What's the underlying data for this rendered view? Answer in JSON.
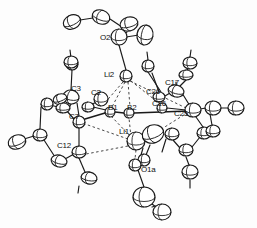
{
  "figure": {
    "kind": "ortep-crystal-structure-diagram",
    "width": 257,
    "height": 228,
    "background_color": "#fdfdfd",
    "line_color": "#1a1a1a",
    "ellipsoid_fill": "#ffffff",
    "dashed_bond_color": "#333333"
  },
  "labels": [
    {
      "text": "O2",
      "x": 100,
      "y": 34
    },
    {
      "text": "Li2",
      "x": 104,
      "y": 71
    },
    {
      "text": "C3",
      "x": 71,
      "y": 85
    },
    {
      "text": "C2",
      "x": 91,
      "y": 89
    },
    {
      "text": "C17",
      "x": 165,
      "y": 79
    },
    {
      "text": "C26",
      "x": 146,
      "y": 88
    },
    {
      "text": "C16",
      "x": 152,
      "y": 100
    },
    {
      "text": "B1",
      "x": 108,
      "y": 104
    },
    {
      "text": "B2",
      "x": 127,
      "y": 104
    },
    {
      "text": "C7",
      "x": 69,
      "y": 113
    },
    {
      "text": "C25",
      "x": 174,
      "y": 110
    },
    {
      "text": "Li1",
      "x": 119,
      "y": 128
    },
    {
      "text": "C12",
      "x": 57,
      "y": 142
    },
    {
      "text": "O1a",
      "x": 141,
      "y": 166
    }
  ],
  "atoms": [
    {
      "id": "e1",
      "cx": 72,
      "cy": 22,
      "rx": 9,
      "ry": 7,
      "rot": -25
    },
    {
      "id": "e2",
      "cx": 101,
      "cy": 17,
      "rx": 9,
      "ry": 7,
      "rot": 20
    },
    {
      "id": "e3",
      "cx": 129,
      "cy": 24,
      "rx": 9,
      "ry": 7,
      "rot": -15
    },
    {
      "id": "o2",
      "cx": 119,
      "cy": 37,
      "rx": 8,
      "ry": 8,
      "rot": 0
    },
    {
      "id": "e4",
      "cx": 145,
      "cy": 35,
      "rx": 8,
      "ry": 10,
      "rot": 10
    },
    {
      "id": "li2",
      "cx": 126,
      "cy": 76,
      "rx": 6,
      "ry": 6,
      "rot": 0
    },
    {
      "id": "e5",
      "cx": 148,
      "cy": 66,
      "rx": 6,
      "ry": 6,
      "rot": 0
    },
    {
      "id": "e6",
      "cx": 190,
      "cy": 63,
      "rx": 7,
      "ry": 6,
      "rot": 0
    },
    {
      "id": "e7",
      "cx": 72,
      "cy": 64,
      "rx": 6,
      "ry": 6,
      "rot": 0
    },
    {
      "id": "c3",
      "cx": 71,
      "cy": 97,
      "rx": 8,
      "ry": 7,
      "rot": 10
    },
    {
      "id": "c2",
      "cx": 101,
      "cy": 99,
      "rx": 7,
      "ry": 7,
      "rot": 0
    },
    {
      "id": "e8",
      "cx": 60,
      "cy": 99,
      "rx": 7,
      "ry": 5,
      "rot": -20
    },
    {
      "id": "e9",
      "cx": 47,
      "cy": 104,
      "rx": 6,
      "ry": 6,
      "rot": 0
    },
    {
      "id": "e10",
      "cx": 63,
      "cy": 108,
      "rx": 7,
      "ry": 5,
      "rot": 0
    },
    {
      "id": "e11",
      "cx": 88,
      "cy": 107,
      "rx": 6,
      "ry": 5,
      "rot": 0
    },
    {
      "id": "b1",
      "cx": 110,
      "cy": 112,
      "rx": 5,
      "ry": 5,
      "rot": 0
    },
    {
      "id": "b2",
      "cx": 129,
      "cy": 113,
      "rx": 5,
      "ry": 5,
      "rot": 0
    },
    {
      "id": "c7",
      "cx": 79,
      "cy": 122,
      "rx": 6,
      "ry": 6,
      "rot": 0
    },
    {
      "id": "c17",
      "cx": 176,
      "cy": 91,
      "rx": 8,
      "ry": 6,
      "rot": 15
    },
    {
      "id": "c26",
      "cx": 159,
      "cy": 97,
      "rx": 6,
      "ry": 5,
      "rot": 0
    },
    {
      "id": "c16",
      "cx": 162,
      "cy": 108,
      "rx": 5,
      "ry": 5,
      "rot": 0
    },
    {
      "id": "c25",
      "cx": 193,
      "cy": 110,
      "rx": 8,
      "ry": 7,
      "rot": 0
    },
    {
      "id": "e12",
      "cx": 213,
      "cy": 108,
      "rx": 8,
      "ry": 7,
      "rot": 0
    },
    {
      "id": "e13",
      "cx": 236,
      "cy": 108,
      "rx": 8,
      "ry": 7,
      "rot": 0
    },
    {
      "id": "e14",
      "cx": 186,
      "cy": 75,
      "rx": 7,
      "ry": 5,
      "rot": 0
    },
    {
      "id": "li1",
      "cx": 136,
      "cy": 141,
      "rx": 9,
      "ry": 9,
      "rot": 0
    },
    {
      "id": "e15",
      "cx": 153,
      "cy": 134,
      "rx": 11,
      "ry": 9,
      "rot": -20
    },
    {
      "id": "e16",
      "cx": 172,
      "cy": 134,
      "rx": 7,
      "ry": 6,
      "rot": 0
    },
    {
      "id": "e17",
      "cx": 144,
      "cy": 160,
      "rx": 6,
      "ry": 6,
      "rot": 0
    },
    {
      "id": "o1a",
      "cx": 135,
      "cy": 165,
      "rx": 6,
      "ry": 6,
      "rot": 0
    },
    {
      "id": "e18",
      "cx": 144,
      "cy": 197,
      "rx": 11,
      "ry": 10,
      "rot": 0
    },
    {
      "id": "e19",
      "cx": 162,
      "cy": 212,
      "rx": 9,
      "ry": 8,
      "rot": 0
    },
    {
      "id": "c12",
      "cx": 79,
      "cy": 152,
      "rx": 7,
      "ry": 6,
      "rot": 0
    },
    {
      "id": "e20",
      "cx": 40,
      "cy": 135,
      "rx": 7,
      "ry": 6,
      "rot": 0
    },
    {
      "id": "e21",
      "cx": 17,
      "cy": 142,
      "rx": 9,
      "ry": 7,
      "rot": -20
    },
    {
      "id": "e22",
      "cx": 59,
      "cy": 161,
      "rx": 8,
      "ry": 6,
      "rot": 15
    },
    {
      "id": "e23",
      "cx": 89,
      "cy": 178,
      "rx": 8,
      "ry": 6,
      "rot": 10
    },
    {
      "id": "e24",
      "cx": 71,
      "cy": 62,
      "rx": 7,
      "ry": 6,
      "rot": 0
    },
    {
      "id": "e25",
      "cx": 204,
      "cy": 133,
      "rx": 7,
      "ry": 6,
      "rot": 0
    },
    {
      "id": "e26",
      "cx": 186,
      "cy": 150,
      "rx": 7,
      "ry": 6,
      "rot": 0
    },
    {
      "id": "e27",
      "cx": 190,
      "cy": 172,
      "rx": 8,
      "ry": 7,
      "rot": 0
    },
    {
      "id": "e28",
      "cx": 213,
      "cy": 131,
      "rx": 7,
      "ry": 6,
      "rot": 0
    }
  ]
}
